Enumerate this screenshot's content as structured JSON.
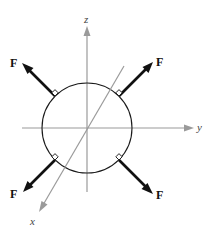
{
  "diagram": {
    "axes": {
      "x_label": "x",
      "y_label": "y",
      "z_label": "z",
      "color": "#9a9a9a"
    },
    "sphere": {
      "center": [
        87,
        128
      ],
      "radius": 45
    },
    "forces": [
      {
        "label": "F",
        "position": "upper-left",
        "direction_deg": 135
      },
      {
        "label": "F",
        "position": "upper-right",
        "direction_deg": 45
      },
      {
        "label": "F",
        "position": "lower-left",
        "direction_deg": 225
      },
      {
        "label": "F",
        "position": "lower-right",
        "direction_deg": 315
      }
    ],
    "force_color": "#111111",
    "right_angle_markers": 4
  }
}
